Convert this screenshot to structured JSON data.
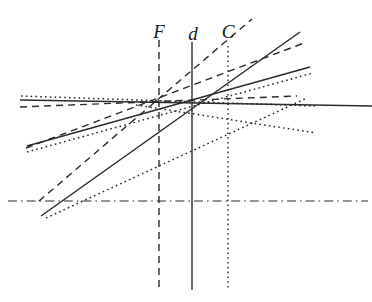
{
  "figure": {
    "width": 372,
    "height": 302,
    "background_color": "#ffffff",
    "ink_color": "#1a1a1a"
  },
  "labels": [
    {
      "id": "label-F",
      "text": "F",
      "x": 159,
      "y": 22
    },
    {
      "id": "label-d",
      "text": "d",
      "x": 193,
      "y": 24
    },
    {
      "id": "label-C",
      "text": "C",
      "x": 228,
      "y": 22
    }
  ],
  "chart_data": {
    "type": "line",
    "xlabel": "",
    "ylabel": "",
    "xlim": [
      0,
      372
    ],
    "ylim": [
      302,
      0
    ],
    "grid": false,
    "legend": null,
    "annotations": [
      "F",
      "d",
      "C"
    ],
    "vertical_reference_lines": [
      {
        "name": "F",
        "label": "F",
        "x": 159,
        "y_top": 40,
        "y_bottom": 290,
        "style": "dashed",
        "color": "#2b2b2b",
        "width": 1.4
      },
      {
        "name": "d",
        "label": "d",
        "x": 192,
        "y_top": 42,
        "y_bottom": 290,
        "style": "solid",
        "color": "#2b2b2b",
        "width": 1.4
      },
      {
        "name": "C",
        "label": "C",
        "x": 228,
        "y_top": 46,
        "y_bottom": 290,
        "style": "dotted",
        "color": "#2b2b2b",
        "width": 1.4
      }
    ],
    "horizontal_reference_lines": [
      {
        "name": "baseline",
        "y": 201,
        "x_start": 8,
        "x_end": 368,
        "style": "dashdot",
        "color": "#2b2b2b",
        "width": 1.1
      }
    ],
    "series": [
      {
        "name": "solid-horizontal",
        "style": "solid",
        "color": "#2b2b2b",
        "width": 1.5,
        "x": [
          20,
          372
        ],
        "y": [
          100,
          106
        ]
      },
      {
        "name": "solid-shallow-rising",
        "style": "solid",
        "color": "#2b2b2b",
        "width": 1.5,
        "x": [
          27,
          310
        ],
        "y": [
          146,
          67
        ]
      },
      {
        "name": "solid-steep-rising",
        "style": "solid",
        "color": "#2b2b2b",
        "width": 1.5,
        "x": [
          41,
          300
        ],
        "y": [
          216,
          32
        ]
      },
      {
        "name": "dashed-horizontal",
        "style": "dashed",
        "color": "#2b2b2b",
        "width": 1.4,
        "x": [
          20,
          297
        ],
        "y": [
          107,
          96
        ]
      },
      {
        "name": "dashed-shallow-rising",
        "style": "dashed",
        "color": "#2b2b2b",
        "width": 1.4,
        "x": [
          26,
          304
        ],
        "y": [
          148,
          43
        ]
      },
      {
        "name": "dashed-steep-rising",
        "style": "dashed",
        "color": "#2b2b2b",
        "width": 1.4,
        "x": [
          39,
          252
        ],
        "y": [
          201,
          19
        ]
      },
      {
        "name": "dotted-horizontal",
        "style": "dotted",
        "color": "#2b2b2b",
        "width": 1.5,
        "x": [
          21,
          315
        ],
        "y": [
          96,
          106
        ]
      },
      {
        "name": "dotted-shallow-rising",
        "style": "dotted",
        "color": "#2b2b2b",
        "width": 1.5,
        "x": [
          27,
          313
        ],
        "y": [
          152,
          73
        ]
      },
      {
        "name": "dotted-steep-rising",
        "style": "dotted",
        "color": "#2b2b2b",
        "width": 1.5,
        "x": [
          46,
          307
        ],
        "y": [
          218,
          98
        ]
      },
      {
        "name": "dotted-descending",
        "style": "dotted",
        "color": "#2b2b2b",
        "width": 1.5,
        "x": [
          136,
          316
        ],
        "y": [
          105,
          133
        ]
      }
    ]
  }
}
